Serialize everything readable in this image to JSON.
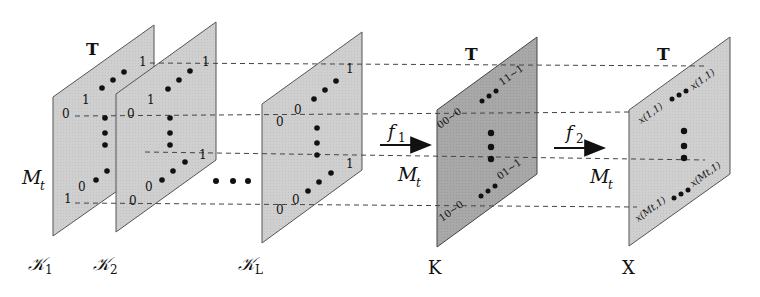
{
  "colors": {
    "plane_light": "#cfcfcf",
    "plane_dark": "#a6a6a6",
    "plane_stroke": "#555555",
    "dashed_line": "#444444",
    "text": "#111111",
    "dot": "#111111"
  },
  "axis_labels": {
    "time": "T",
    "rows_left": "M",
    "rows_left_sub": "t"
  },
  "planes": [
    {
      "id": "K1",
      "label": "𝒦",
      "sub": "1",
      "top_label": "T",
      "codes": [
        "1",
        "1",
        "0",
        "1",
        "0",
        "1"
      ]
    },
    {
      "id": "K2",
      "label": "𝒦",
      "sub": "2",
      "codes": [
        "1",
        "1",
        "0",
        "1",
        "0",
        "0"
      ]
    },
    {
      "id": "KL",
      "label": "𝒦",
      "sub": "L",
      "codes": [
        "1",
        "0",
        "0",
        "1",
        "0",
        "0"
      ]
    },
    {
      "id": "K",
      "label": "K",
      "top_label": "T",
      "codes": [
        "11~1",
        "00~0",
        "01~1",
        "10~0"
      ]
    },
    {
      "id": "X",
      "label": "X",
      "top_label": "T",
      "cells": [
        "x(1,1)",
        "x(1,1)",
        "x(Mt,1)",
        "x(Mt,1)"
      ]
    }
  ],
  "ellipsis": "• • •",
  "arrows": [
    {
      "id": "f1",
      "label": "f",
      "sub": "1",
      "below": "M",
      "below_sub": "t"
    },
    {
      "id": "f2",
      "label": "f",
      "sub": "2",
      "below": "M",
      "below_sub": "t"
    }
  ]
}
